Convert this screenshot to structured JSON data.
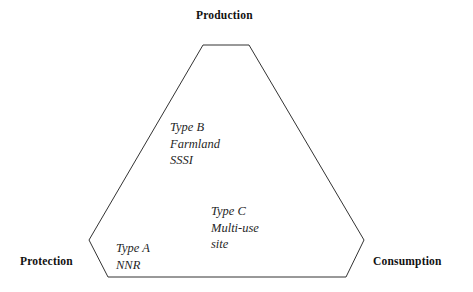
{
  "diagram": {
    "type": "triangular-conceptual-model",
    "shape": {
      "name": "truncated-triangle-hexagon",
      "stroke_color": "#333333",
      "fill_color": "#ffffff",
      "stroke_width": 1,
      "vertices": [
        {
          "x": 203,
          "y": 45
        },
        {
          "x": 249,
          "y": 45
        },
        {
          "x": 364,
          "y": 240
        },
        {
          "x": 346,
          "y": 277
        },
        {
          "x": 108,
          "y": 277
        },
        {
          "x": 89,
          "y": 240
        }
      ]
    },
    "corner_labels": [
      {
        "id": "production",
        "text": "Production",
        "position": "top"
      },
      {
        "id": "protection",
        "text": "Protection",
        "position": "bottom-left"
      },
      {
        "id": "consumption",
        "text": "Consumption",
        "position": "bottom-right"
      }
    ],
    "type_blocks": [
      {
        "id": "type-b",
        "lines": [
          "Type B",
          "Farmland",
          "SSSI"
        ],
        "position": "upper-left-interior"
      },
      {
        "id": "type-c",
        "lines": [
          "Type C",
          "Multi-use",
          "site"
        ],
        "position": "lower-center-interior"
      },
      {
        "id": "type-a",
        "lines": [
          "Type A",
          "NNR"
        ],
        "position": "bottom-left-interior"
      }
    ]
  }
}
